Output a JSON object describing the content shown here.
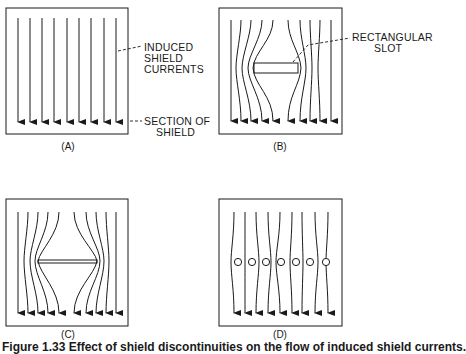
{
  "figure": {
    "panels": [
      {
        "id": "A",
        "label": "(A)",
        "description": "Uniform induced currents in unbroken shield section"
      },
      {
        "id": "B",
        "label": "(B)",
        "description": "Currents diverted around a rectangular slot"
      },
      {
        "id": "C",
        "label": "(C)",
        "description": "Currents diverted around a thin slot"
      },
      {
        "id": "D",
        "label": "(D)",
        "description": "Currents slightly perturbed by a row of small holes"
      }
    ],
    "annotations": {
      "induced_currents": [
        "INDUCED",
        "SHIELD",
        "CURRENTS"
      ],
      "section_of_shield": [
        "SECTION OF",
        "SHIELD"
      ],
      "rectangular_slot": [
        "RECTANGULAR",
        "SLOT"
      ]
    },
    "caption": "Figure 1.33   Effect of shield discontinuities on the flow of induced shield currents."
  },
  "colors": {
    "ink": "#1a1a1a",
    "background": "#ffffff"
  }
}
